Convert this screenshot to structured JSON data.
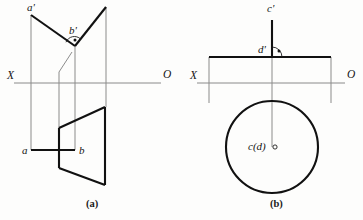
{
  "figure": {
    "background_color": "#fdfdfc",
    "ink_color": "#111111",
    "thin_color": "#777777",
    "axis_color": "#8a8a8a"
  },
  "panels": [
    {
      "id": "a",
      "caption": "(a)",
      "caption_pos": {
        "x": 86,
        "y": 207
      },
      "axis": {
        "label_left": "X",
        "label_right": "O",
        "label_left_pos": {
          "x": 7,
          "y": 79
        },
        "label_right_pos": {
          "x": 163,
          "y": 78
        },
        "line": {
          "x1": 14,
          "y1": 83,
          "x2": 161,
          "y2": 83
        }
      },
      "points": [
        {
          "name": "a-prime",
          "label": "a'",
          "x": 31,
          "y": 15,
          "label_pos": {
            "x": 27,
            "y": 11
          }
        },
        {
          "name": "b-prime",
          "label": "b'",
          "x": 75,
          "y": 46,
          "label_pos": {
            "x": 69,
            "y": 34
          }
        },
        {
          "name": "a",
          "label": "a",
          "x": 31,
          "y": 150,
          "label_pos": {
            "x": 22,
            "y": 154
          }
        },
        {
          "name": "b",
          "label": "b",
          "x": 75,
          "y": 150,
          "label_pos": {
            "x": 79,
            "y": 154
          }
        }
      ],
      "thick_segments": [
        {
          "name": "ab-prime-front-line",
          "x1": 31,
          "y1": 15,
          "x2": 75,
          "y2": 46
        },
        {
          "name": "plane-edge-rising",
          "x1": 75,
          "y1": 46,
          "x2": 106,
          "y2": 7
        },
        {
          "name": "ab-top-line",
          "x1": 31,
          "y1": 150,
          "x2": 75,
          "y2": 150
        },
        {
          "name": "trapezoid-top",
          "x1": 59,
          "y1": 128,
          "x2": 105,
          "y2": 107
        },
        {
          "name": "trapezoid-right",
          "x1": 105,
          "y1": 107,
          "x2": 105,
          "y2": 185
        },
        {
          "name": "trapezoid-bottom",
          "x1": 105,
          "y1": 185,
          "x2": 59,
          "y2": 168
        },
        {
          "name": "trapezoid-left",
          "x1": 59,
          "y1": 168,
          "x2": 59,
          "y2": 128
        }
      ],
      "thin_segments": [
        {
          "name": "projector-a",
          "x1": 31,
          "y1": 15,
          "x2": 31,
          "y2": 150
        },
        {
          "name": "projector-b",
          "x1": 75,
          "y1": 46,
          "x2": 75,
          "y2": 150
        },
        {
          "name": "plane-front-left-edge",
          "x1": 59,
          "y1": 72,
          "x2": 59,
          "y2": 128
        },
        {
          "name": "plane-front-right-edge",
          "x1": 106,
          "y1": 7,
          "x2": 106,
          "y2": 107
        },
        {
          "name": "plane-front-slope",
          "x1": 59,
          "y1": 72,
          "x2": 72,
          "y2": 52
        }
      ],
      "right_angle": {
        "name": "right-angle-mark-b-prime",
        "vertex": {
          "x": 75,
          "y": 46
        },
        "arc_radius": 9,
        "dot": {
          "x": 75,
          "y": 40,
          "r": 1.5
        }
      }
    },
    {
      "id": "b",
      "caption": "(b)",
      "caption_pos": {
        "x": 270,
        "y": 207
      },
      "axis": {
        "label_left": "X",
        "label_right": "O",
        "label_left_pos": {
          "x": 190,
          "y": 79
        },
        "label_right_pos": {
          "x": 347,
          "y": 78
        },
        "line": {
          "x1": 197,
          "y1": 83,
          "x2": 345,
          "y2": 83
        }
      },
      "points": [
        {
          "name": "c-prime",
          "label": "c'",
          "x": 272,
          "y": 20,
          "label_pos": {
            "x": 267,
            "y": 12
          }
        },
        {
          "name": "d-prime",
          "label": "d'",
          "x": 272,
          "y": 57,
          "label_pos": {
            "x": 258,
            "y": 53
          }
        },
        {
          "name": "c-d",
          "label": "c(d)",
          "x": 272,
          "y": 147,
          "label_pos": {
            "x": 248,
            "y": 150
          }
        }
      ],
      "thick_segments": [
        {
          "name": "cd-prime-vertical-line",
          "x1": 272,
          "y1": 20,
          "x2": 272,
          "y2": 57
        },
        {
          "name": "plane-front-top-edge",
          "x1": 209,
          "y1": 57,
          "x2": 331,
          "y2": 57
        }
      ],
      "thin_segments": [
        {
          "name": "plane-front-left-edge",
          "x1": 209,
          "y1": 57,
          "x2": 209,
          "y2": 103
        },
        {
          "name": "plane-front-right-edge",
          "x1": 331,
          "y1": 57,
          "x2": 331,
          "y2": 103
        },
        {
          "name": "projector-cd",
          "x1": 272,
          "y1": 57,
          "x2": 272,
          "y2": 147
        }
      ],
      "circle": {
        "name": "plane-top-view-circle",
        "cx": 272,
        "cy": 147,
        "r": 46
      },
      "center_marker": {
        "name": "center-point-marker",
        "cx": 275,
        "cy": 147,
        "r": 2.1
      },
      "right_angle": {
        "name": "right-angle-mark-d-prime",
        "vertex": {
          "x": 272,
          "y": 57
        },
        "arc_radius": 10,
        "dot": {
          "x": 279,
          "y": 51,
          "r": 1.5
        }
      }
    }
  ]
}
